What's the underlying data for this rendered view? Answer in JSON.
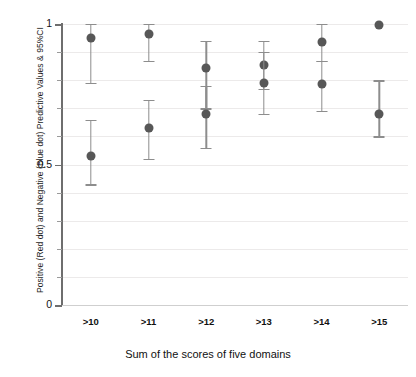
{
  "chart_data": {
    "type": "scatter",
    "title": "",
    "xlabel": "Sum of the scores of five domains",
    "ylabel": "Positive (Red dot) and Negative (Blue dot) Predictive Values & 95%CI",
    "categories": [
      ">10",
      ">11",
      ">12",
      ">13",
      ">14",
      ">15"
    ],
    "ylim": [
      0,
      1
    ],
    "yticks": [
      0,
      0.5,
      1
    ],
    "ytick_labels": [
      "0",
      "0.5",
      "1"
    ],
    "yminor_step": 0.1,
    "grid": true,
    "legend": "none",
    "colors": {
      "positive_predictive_value": "#575757",
      "negative_predictive_value": "#575757",
      "errorbar": "#8d8d8d",
      "gridline": "#eceaea",
      "axis": "#6e6e6e"
    },
    "series": [
      {
        "name": "Positive (Red dot) Predictive Value",
        "key": "ppv",
        "values": [
          0.95,
          0.965,
          0.845,
          0.855,
          0.935,
          0.995
        ],
        "ci_lower": [
          0.79,
          0.87,
          0.7,
          0.77,
          0.87,
          null
        ],
        "ci_upper": [
          1.0,
          1.0,
          0.94,
          0.94,
          1.0,
          null
        ]
      },
      {
        "name": "Negative (Blue dot) Predictive Value",
        "key": "npv",
        "values": [
          0.53,
          0.63,
          0.68,
          0.79,
          0.785,
          0.68
        ],
        "ci_lower": [
          0.43,
          0.52,
          0.56,
          0.68,
          0.69,
          0.6
        ],
        "ci_upper": [
          0.66,
          0.73,
          0.78,
          0.9,
          0.87,
          0.8
        ]
      }
    ]
  }
}
